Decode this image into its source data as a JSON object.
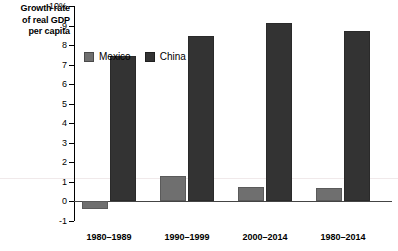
{
  "chart_data": {
    "type": "bar",
    "title": "",
    "ylabel": "Growth rate of real GDP per capita",
    "ylabel_lines": [
      "Growth rate",
      "of real GDP",
      "per capita"
    ],
    "xlabel": "",
    "categories": [
      "1980–1989",
      "1990–1999",
      "2000–2014",
      "1980–2014"
    ],
    "series": [
      {
        "name": "Mexico",
        "color": "#6f6f6f",
        "values": [
          -0.4,
          1.3,
          0.75,
          0.7
        ]
      },
      {
        "name": "China",
        "color": "#333333",
        "values": [
          7.45,
          8.45,
          9.15,
          8.7
        ]
      }
    ],
    "ylim": [
      -1,
      10
    ],
    "yticks": [
      10,
      9,
      8,
      7,
      6,
      5,
      4,
      3,
      2,
      1,
      0,
      -1
    ],
    "ytick_labels": [
      "10%",
      "9",
      "8",
      "7",
      "6",
      "5",
      "4",
      "3",
      "2",
      "1",
      "0",
      "-1"
    ],
    "grid": false,
    "legend_position": "top-left-inside"
  },
  "legend": {
    "items": [
      {
        "label": "Mexico"
      },
      {
        "label": "China"
      }
    ]
  }
}
